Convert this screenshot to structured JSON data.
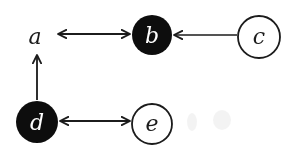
{
  "diagram": {
    "type": "directed-graph",
    "colors": {
      "filled_node": "#111111",
      "hollow_node_fill": "#ffffff",
      "stroke": "#1a1a1a",
      "filled_label": "#ffffff",
      "hollow_label": "#1a1a1a"
    },
    "nodes": [
      {
        "id": "a",
        "label": "a",
        "style": "plain",
        "cx": 35,
        "cy": 37
      },
      {
        "id": "b",
        "label": "b",
        "style": "filled",
        "cx": 152,
        "cy": 35,
        "r": 20
      },
      {
        "id": "c",
        "label": "c",
        "style": "hollow",
        "cx": 259,
        "cy": 38,
        "r": 22
      },
      {
        "id": "d",
        "label": "d",
        "style": "filled",
        "cx": 37,
        "cy": 122,
        "r": 21
      },
      {
        "id": "e",
        "label": "e",
        "style": "hollow",
        "cx": 152,
        "cy": 125,
        "r": 20
      }
    ],
    "edges": [
      {
        "from": "a",
        "to": "b",
        "direction": "both"
      },
      {
        "from": "c",
        "to": "b",
        "direction": "forward"
      },
      {
        "from": "d",
        "to": "a",
        "direction": "forward"
      },
      {
        "from": "d",
        "to": "e",
        "direction": "both"
      }
    ]
  }
}
